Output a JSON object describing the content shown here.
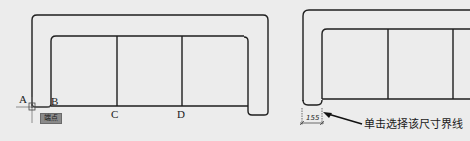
{
  "left_figure": {
    "points": {
      "A": "A",
      "B": "B",
      "C": "C",
      "D": "D"
    },
    "snap_tooltip": "端点"
  },
  "right_figure": {
    "dimension_value": "155",
    "callout_text": "单击选择该尺寸界线"
  },
  "colors": {
    "line": "#1e1e1e",
    "background": "#ececec",
    "tooltip_bg": "#8a8a8a"
  }
}
